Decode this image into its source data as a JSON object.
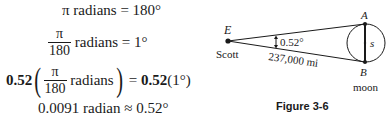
{
  "equations": {
    "line1": {
      "pi": "π",
      "lhs_text": " radians = 180°"
    },
    "line2": {
      "frac_num": "π",
      "frac_den": "180",
      "rhs_text": " radians = 1°"
    },
    "line3": {
      "coef_left": "0.52",
      "open_paren": "(",
      "frac_num": "π",
      "frac_den": "180",
      "inner_text": " radians",
      "close_paren": ")",
      "equals": " = ",
      "coef_right": "0.52",
      "rhs_text": "(1°)"
    },
    "line4": {
      "text": "0.0091 radian ≈ 0.52°"
    }
  },
  "diagram": {
    "point_e_label": "E",
    "observer_label": "Scott",
    "angle_label": "0.52°",
    "distance_label": "237,000 mi",
    "point_a_label": "A",
    "point_b_label": "B",
    "arc_label": "s",
    "body_label": "moon",
    "caption": "Figure 3-6"
  }
}
